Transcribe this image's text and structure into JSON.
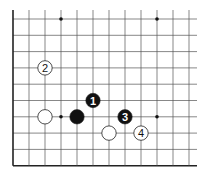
{
  "diagram": {
    "type": "go-board-fragment",
    "columns": 12,
    "rows": 10,
    "edges": [
      "left",
      "bottom"
    ],
    "star_points": [
      [
        3,
        0
      ],
      [
        9,
        0
      ],
      [
        3,
        6
      ],
      [
        9,
        6
      ]
    ],
    "stones": [
      {
        "color": "white",
        "col": 2,
        "row": 3,
        "label": "2"
      },
      {
        "color": "white",
        "col": 2,
        "row": 6,
        "label": ""
      },
      {
        "color": "black",
        "col": 4,
        "row": 6,
        "label": ""
      },
      {
        "color": "black",
        "col": 5,
        "row": 5,
        "label": "1"
      },
      {
        "color": "black",
        "col": 7,
        "row": 6,
        "label": "3"
      },
      {
        "color": "white",
        "col": 6,
        "row": 7,
        "label": ""
      },
      {
        "color": "white",
        "col": 8,
        "row": 7,
        "label": "4"
      }
    ],
    "colors": {
      "line": "#555555",
      "edge": "#222222",
      "black": "#111111",
      "white": "#ffffff"
    }
  }
}
